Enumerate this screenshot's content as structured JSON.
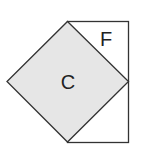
{
  "diagram": {
    "shapes": [
      {
        "id": "square-c",
        "label": "C",
        "kind": "rotated-square",
        "fill": "#e6e6e6"
      },
      {
        "id": "rectangle-f",
        "label": "F",
        "kind": "rectangle",
        "fill": "#ffffff"
      }
    ],
    "stroke_color": "#333333"
  }
}
